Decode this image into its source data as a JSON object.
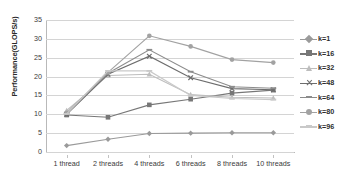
{
  "chart_data": {
    "type": "line",
    "title": "",
    "xlabel": "",
    "ylabel": "Performance(GLOPS/s)",
    "categories": [
      "1 thread",
      "2 threads",
      "4 threads",
      "6 threads",
      "8 threads",
      "10 threads"
    ],
    "ylim": [
      0,
      35
    ],
    "ytick_step": 5,
    "yticks": [
      "0",
      "5",
      "10",
      "15",
      "20",
      "25",
      "30",
      "35"
    ],
    "grid": true,
    "legend_position": "right",
    "series": [
      {
        "name": "k=1",
        "values": [
          1.7,
          3.4,
          4.9,
          5.0,
          5.1,
          5.1
        ],
        "color": "#9a9a9a",
        "marker": "diamond"
      },
      {
        "name": "k=16",
        "values": [
          9.8,
          9.2,
          12.5,
          14.0,
          15.6,
          16.4
        ],
        "color": "#777777",
        "marker": "square"
      },
      {
        "name": "k=32",
        "values": [
          11.0,
          20.3,
          20.6,
          15.2,
          14.5,
          14.3
        ],
        "color": "#bdbdbd",
        "marker": "triangle"
      },
      {
        "name": "k=48",
        "values": [
          10.0,
          20.6,
          25.4,
          19.7,
          16.8,
          16.5
        ],
        "color": "#6d6d6d",
        "marker": "x"
      },
      {
        "name": "k=64",
        "values": [
          10.2,
          20.9,
          27.1,
          21.3,
          17.3,
          16.9
        ],
        "color": "#8c8c8c",
        "marker": "dash"
      },
      {
        "name": "k=80",
        "values": [
          10.4,
          21.1,
          30.8,
          28.0,
          24.5,
          23.7
        ],
        "color": "#a2a2a2",
        "marker": "circle"
      },
      {
        "name": "k=96",
        "values": [
          10.1,
          21.5,
          21.5,
          15.0,
          14.2,
          13.9
        ],
        "color": "#c9c9c9",
        "marker": "dash"
      }
    ]
  }
}
